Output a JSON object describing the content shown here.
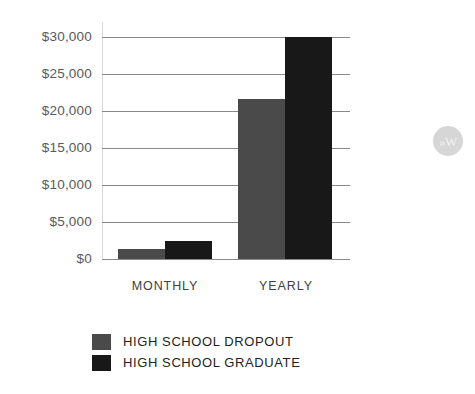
{
  "chart_data": {
    "type": "bar",
    "title": "",
    "subtitle": "",
    "xlabel": "",
    "ylabel": "",
    "categories": [
      "MONTHLY",
      "YEARLY"
    ],
    "series": [
      {
        "name": "HIGH SCHOOL DROPOUT",
        "color": "#4a4a4a",
        "values": [
          1400,
          21600
        ]
      },
      {
        "name": "HIGH SCHOOL GRADUATE",
        "color": "#181818",
        "values": [
          2400,
          30000
        ]
      }
    ],
    "ylim": [
      0,
      30000
    ],
    "ytick_values": [
      0,
      5000,
      10000,
      15000,
      20000,
      25000,
      30000
    ],
    "ytick_labels": [
      "$0",
      "$5,000",
      "$10,000",
      "$15,000",
      "$20,000",
      "$25,000",
      "$30,000"
    ],
    "grid": true,
    "grid_color": "#8a8a8a",
    "legend_position": "bottom-left",
    "background": "#ffffff"
  },
  "legend": {
    "entries": [
      {
        "label": "HIGH SCHOOL DROPOUT",
        "swatch": "dropout"
      },
      {
        "label": "HIGH SCHOOL GRADUATE",
        "swatch": "graduate"
      }
    ]
  },
  "watermark": {
    "text": "»W"
  }
}
